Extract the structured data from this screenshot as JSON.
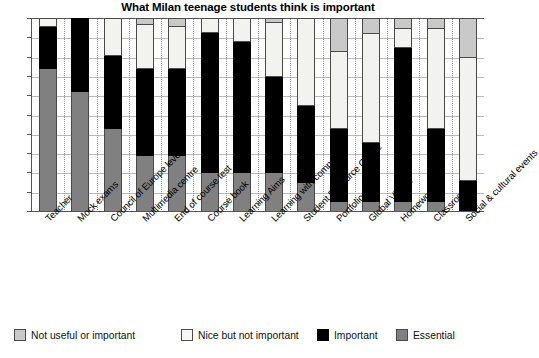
{
  "chart_data": {
    "type": "bar",
    "subtype": "stacked-bar-100-percent",
    "title": "What Milan teenage students think is important",
    "xlabel": "",
    "ylabel": "",
    "ylim": [
      0,
      100
    ],
    "ytick_labels": [
      "0%",
      "10%",
      "20%",
      "30%",
      "40%",
      "50%",
      "60%",
      "70%",
      "80%",
      "90%",
      "100%"
    ],
    "ytick_values": [
      0,
      10,
      20,
      30,
      40,
      50,
      60,
      70,
      80,
      90,
      100
    ],
    "grid": true,
    "legend_position": "bottom",
    "categories": [
      "Teacher",
      "Mock exams",
      "Council of Europe levels",
      "Multimedia centre",
      "End of course test",
      "Course book",
      "Learning Aims",
      "Learning with computers",
      "Student Resource Centre",
      "Portfolio",
      "Global Village",
      "Homework",
      "Classroom",
      "Social & cultural events"
    ],
    "series": [
      {
        "name": "Essential",
        "color": "#808080",
        "values": [
          74,
          62,
          43,
          29,
          29,
          20,
          20,
          20,
          15,
          5,
          5,
          5,
          5,
          0
        ]
      },
      {
        "name": "Important",
        "color": "#000000",
        "values": [
          22,
          38,
          38,
          45,
          45,
          73,
          68,
          50,
          40,
          38,
          31,
          80,
          38,
          16
        ]
      },
      {
        "name": "Nice but not important",
        "color": "#f2f2ef",
        "values": [
          4,
          0,
          19,
          23,
          22,
          7,
          12,
          28,
          45,
          40,
          56,
          10,
          52,
          64
        ]
      },
      {
        "name": "Not useful or important",
        "color": "#c9c9c9",
        "values": [
          0,
          0,
          0,
          3,
          4,
          0,
          0,
          2,
          0,
          17,
          8,
          5,
          5,
          20
        ]
      }
    ],
    "legend": [
      {
        "label": "Not useful or important",
        "color": "#c9c9c9",
        "key": "notuseful"
      },
      {
        "label": "Nice but not important",
        "color": "#f2f2ef",
        "key": "nice"
      },
      {
        "label": "Important",
        "color": "#000000",
        "key": "important"
      },
      {
        "label": "Essential",
        "color": "#808080",
        "key": "essential"
      }
    ]
  }
}
